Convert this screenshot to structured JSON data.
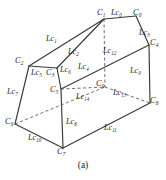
{
  "figure": {
    "caption": "(a)",
    "stroke_color": "#39393d",
    "dashed_color": "#55555a",
    "text_color": "#1d1d20",
    "background": "#ffffff",
    "width": 166,
    "height": 180
  },
  "vertices": [
    {
      "id": "C0",
      "name": "C",
      "sub": "0",
      "x": 136,
      "y": 16,
      "label_x": 133,
      "label_y": 9,
      "hidden": false
    },
    {
      "id": "C1",
      "name": "C",
      "sub": "1",
      "x": 104,
      "y": 19,
      "label_x": 97,
      "label_y": 9,
      "hidden": false
    },
    {
      "id": "C2",
      "name": "C",
      "sub": "2",
      "x": 29,
      "y": 66,
      "label_x": 15,
      "label_y": 57,
      "hidden": false
    },
    {
      "id": "C3",
      "name": "C",
      "sub": "3",
      "x": 57,
      "y": 68,
      "label_x": 46,
      "label_y": 69,
      "hidden": false
    },
    {
      "id": "C4",
      "name": "C",
      "sub": "4",
      "x": 149,
      "y": 45,
      "label_x": 150,
      "label_y": 39,
      "hidden": false
    },
    {
      "id": "C5",
      "name": "C",
      "sub": "5",
      "x": 61,
      "y": 89,
      "label_x": 50,
      "label_y": 86,
      "hidden": false
    },
    {
      "id": "C6",
      "name": "C",
      "sub": "6",
      "x": 15,
      "y": 124,
      "label_x": 5,
      "label_y": 118,
      "hidden": false
    },
    {
      "id": "C7",
      "name": "C",
      "sub": "7",
      "x": 63,
      "y": 148,
      "label_x": 57,
      "label_y": 148,
      "hidden": false
    },
    {
      "id": "C8",
      "name": "C",
      "sub": "8",
      "x": 150,
      "y": 103,
      "label_x": 150,
      "label_y": 97,
      "hidden": false
    },
    {
      "id": "C9",
      "name": "C",
      "sub": "9",
      "x": 105,
      "y": 87,
      "label_x": 96,
      "label_y": 80,
      "hidden": true
    }
  ],
  "edges": [
    {
      "id": "Lc0",
      "name": "Lc",
      "sub": "0",
      "from": "C1",
      "to": "C0",
      "style": "solid",
      "label_x": 111,
      "label_y": 9
    },
    {
      "id": "Lc1",
      "name": "Lc",
      "sub": "1",
      "from": "C2",
      "to": "C1",
      "style": "solid",
      "label_x": 46,
      "label_y": 35
    },
    {
      "id": "Lc2",
      "name": "Lc",
      "sub": "2",
      "from": "C3",
      "to": "C1",
      "style": "solid",
      "label_x": 68,
      "label_y": 48
    },
    {
      "id": "Lc3",
      "name": "Lc",
      "sub": "3",
      "from": "C0",
      "to": "C4",
      "style": "solid",
      "label_x": 139,
      "label_y": 29
    },
    {
      "id": "Lc4",
      "name": "Lc",
      "sub": "4",
      "from": "C5",
      "to": "C4",
      "style": "solid",
      "label_x": 78,
      "label_y": 63
    },
    {
      "id": "Lc5",
      "name": "Lc",
      "sub": "5",
      "from": "C2",
      "to": "C3",
      "style": "solid",
      "label_x": 31,
      "label_y": 69
    },
    {
      "id": "Lc6",
      "name": "Lc",
      "sub": "6",
      "from": "C3",
      "to": "C5",
      "style": "solid",
      "label_x": 60,
      "label_y": 66
    },
    {
      "id": "Lc7",
      "name": "Lc",
      "sub": "7",
      "from": "C2",
      "to": "C6",
      "style": "solid",
      "label_x": 7,
      "label_y": 88
    },
    {
      "id": "Lc8",
      "name": "Lc",
      "sub": "8",
      "from": "C5",
      "to": "C7",
      "style": "solid",
      "label_x": 66,
      "label_y": 118
    },
    {
      "id": "Lc9",
      "name": "Lc",
      "sub": "9",
      "from": "C4",
      "to": "C8",
      "style": "solid",
      "label_x": 130,
      "label_y": 67
    },
    {
      "id": "Lc10",
      "name": "Lc",
      "sub": "10",
      "from": "C6",
      "to": "C7",
      "style": "solid",
      "label_x": 28,
      "label_y": 134
    },
    {
      "id": "Lc11",
      "name": "Lc",
      "sub": "11",
      "from": "C7",
      "to": "C8",
      "style": "solid",
      "label_x": 104,
      "label_y": 124
    },
    {
      "id": "Lc12",
      "name": "Lc",
      "sub": "12",
      "from": "C1",
      "to": "C9",
      "style": "dashed",
      "label_x": 103,
      "label_y": 47
    },
    {
      "id": "Lc13",
      "name": "Lc",
      "sub": "13",
      "from": "C9",
      "to": "C8",
      "style": "dashed",
      "label_x": 113,
      "label_y": 89
    },
    {
      "id": "Lc14",
      "name": "Lc",
      "sub": "14",
      "from": "C5",
      "to": "C9",
      "style": "dashed",
      "label_x": 76,
      "label_y": 93
    }
  ],
  "hidden_edges": [
    {
      "id": "hidden-C6-C9",
      "from": "C6",
      "to": "C9",
      "style": "dashed"
    }
  ]
}
